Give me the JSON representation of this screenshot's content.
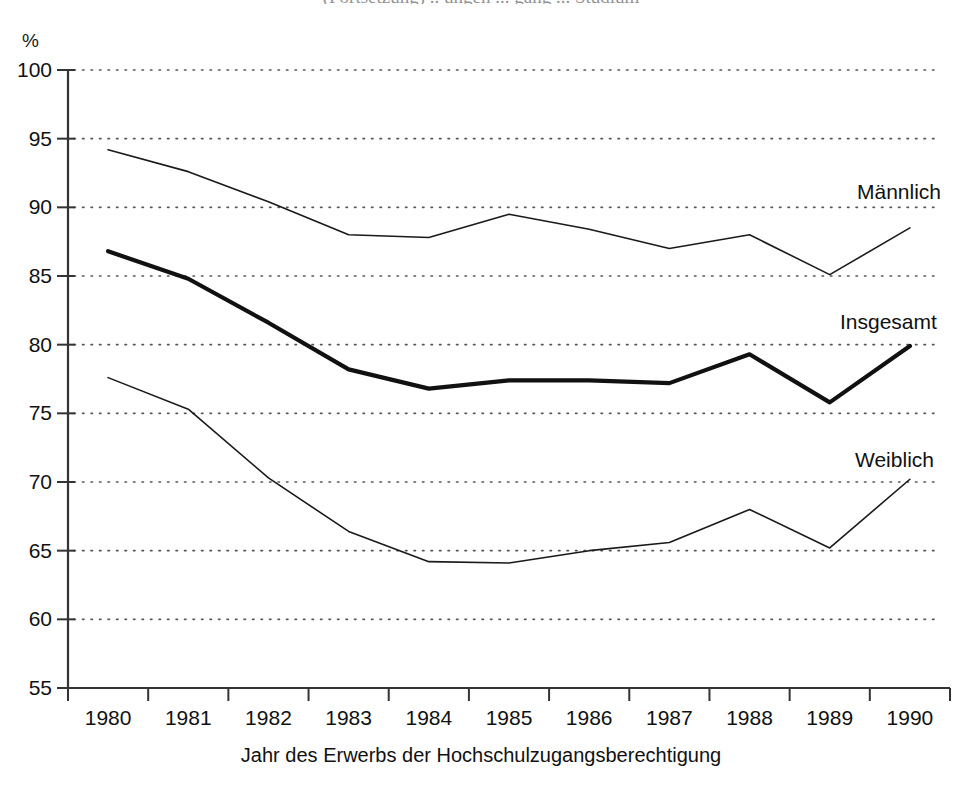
{
  "chart_data": {
    "type": "line",
    "title": "",
    "xlabel": "Jahr des Erwerbs der Hochschulzugangsberechtigung",
    "ylabel": "%",
    "yunit": "%",
    "grid": true,
    "legend_position": "inline-right",
    "xlim": [
      1980,
      1990
    ],
    "ylim": [
      55,
      100
    ],
    "ytick_step": 5,
    "categories": [
      "1980",
      "1981",
      "1982",
      "1983",
      "1984",
      "1985",
      "1986",
      "1987",
      "1988",
      "1989",
      "1990"
    ],
    "xticklabels": [
      "1980",
      "1981",
      "1982",
      "1983",
      "1984",
      "1985",
      "1986",
      "1987",
      "1988",
      "1989",
      "1990"
    ],
    "yticklabels": [
      "100",
      "95",
      "90",
      "85",
      "80",
      "75",
      "70",
      "65",
      "60",
      "55"
    ],
    "yticks": [
      100,
      95,
      90,
      85,
      80,
      75,
      70,
      65,
      60,
      55
    ],
    "series": [
      {
        "name": "Männlich",
        "label": "Männlich",
        "color": "#1a1a1a",
        "linewidth": 1.6,
        "values": [
          94.2,
          92.6,
          90.4,
          88.0,
          87.8,
          89.5,
          88.4,
          87.0,
          88.0,
          85.1,
          88.5
        ]
      },
      {
        "name": "Insgesamt",
        "label": "Insgesamt",
        "color": "#111111",
        "linewidth": 4.2,
        "values": [
          86.8,
          84.8,
          81.6,
          78.2,
          76.8,
          77.4,
          77.4,
          77.2,
          79.3,
          75.8,
          79.9
        ]
      },
      {
        "name": "Weiblich",
        "label": "Weiblich",
        "color": "#1a1a1a",
        "linewidth": 1.6,
        "values": [
          77.6,
          75.3,
          70.3,
          66.4,
          64.2,
          64.1,
          65.0,
          65.6,
          68.0,
          65.2,
          70.2
        ]
      }
    ],
    "annotations": [
      {
        "text": "Männlich",
        "series": "Männlich",
        "x": 857,
        "y": 180
      },
      {
        "text": "Insgesamt",
        "series": "Insgesamt",
        "x": 840,
        "y": 310
      },
      {
        "text": "Weiblich",
        "series": "Weiblich",
        "x": 855,
        "y": 448
      }
    ]
  },
  "figure": {
    "clipped_title": "(Fortsetzung) .. ungen ... gang ... Studium",
    "axis_unit": "%",
    "xaxis_title": "Jahr des Erwerbs der Hochschulzugangsberechtigung"
  }
}
